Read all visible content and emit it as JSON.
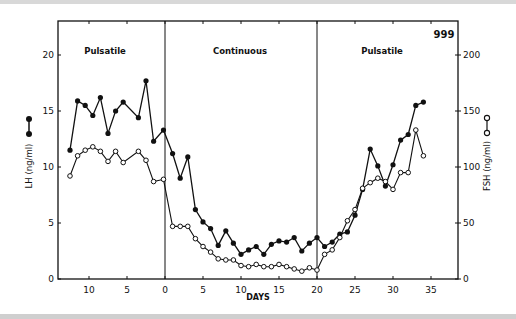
{
  "chart_data": {
    "type": "line",
    "title": "",
    "figure_label": "999",
    "xlabel": "DAYS",
    "ylabel_left": "LH (ng/ml)",
    "ylabel_right": "FSH (ng/ml)",
    "x_tick_labels": [
      "10",
      "5",
      "0",
      "5",
      "10",
      "15",
      "20",
      "25",
      "30",
      "35"
    ],
    "x_tick_values": [
      -10,
      -5,
      0,
      5,
      10,
      15,
      20,
      25,
      30,
      35
    ],
    "y_left_ticks": [
      0,
      5,
      10,
      15,
      20
    ],
    "y_right_ticks": [
      0,
      50,
      100,
      150,
      200
    ],
    "ylim_left": [
      0,
      23
    ],
    "ylim_right": [
      0,
      230
    ],
    "xlim": [
      -14,
      38
    ],
    "grid": false,
    "phases": [
      {
        "label": "Pulsatile",
        "start": -14,
        "end": 0
      },
      {
        "label": "Continuous",
        "start": 0,
        "end": 20
      },
      {
        "label": "Pulsatile",
        "start": 20,
        "end": 38
      }
    ],
    "series": [
      {
        "name": "LH (ng/ml)",
        "marker": "filled-circle",
        "axis": "left",
        "x": [
          -12.5,
          -11.5,
          -10.5,
          -9.5,
          -8.5,
          -7.5,
          -6.5,
          -5.5,
          -3.5,
          -2.5,
          -1.5,
          -0.2,
          1,
          2,
          3,
          4,
          5,
          6,
          7,
          8,
          9,
          10,
          11,
          12,
          13,
          14,
          15,
          16,
          17,
          18,
          19,
          20,
          21,
          22,
          23,
          24,
          25,
          26,
          27,
          28,
          29,
          30,
          31,
          32,
          33,
          34
        ],
        "values": [
          11.5,
          15.9,
          15.5,
          14.6,
          16.2,
          13.0,
          15.0,
          15.8,
          14.4,
          17.7,
          12.3,
          13.3,
          11.2,
          9.0,
          10.9,
          6.2,
          5.1,
          4.5,
          3.0,
          4.3,
          3.2,
          2.2,
          2.6,
          2.9,
          2.2,
          3.1,
          3.4,
          3.3,
          3.7,
          2.5,
          3.2,
          3.7,
          2.9,
          3.3,
          4.0,
          4.2,
          5.7,
          8.0,
          11.6,
          10.1,
          8.3,
          10.2,
          12.4,
          12.9,
          15.5,
          15.8
        ]
      },
      {
        "name": "FSH (ng/ml)",
        "marker": "open-circle",
        "axis": "right",
        "x": [
          -12.5,
          -11.5,
          -10.5,
          -9.5,
          -8.5,
          -7.5,
          -6.5,
          -5.5,
          -3.5,
          -2.5,
          -1.5,
          -0.2,
          1,
          2,
          3,
          4,
          5,
          6,
          7,
          8,
          9,
          10,
          11,
          12,
          13,
          14,
          15,
          16,
          17,
          18,
          19,
          20,
          21,
          22,
          23,
          24,
          25,
          26,
          27,
          28,
          29,
          30,
          31,
          32,
          33,
          34
        ],
        "values": [
          92,
          110,
          115,
          118,
          114,
          105,
          114,
          104,
          114,
          106,
          87,
          89,
          47,
          47,
          47,
          36,
          29,
          24,
          18,
          17,
          17,
          12,
          11,
          13,
          11,
          11,
          13,
          11,
          9,
          7,
          10,
          8,
          22,
          26,
          37,
          52,
          62,
          81,
          86,
          90,
          87,
          80,
          95,
          95,
          133,
          110
        ]
      }
    ]
  }
}
